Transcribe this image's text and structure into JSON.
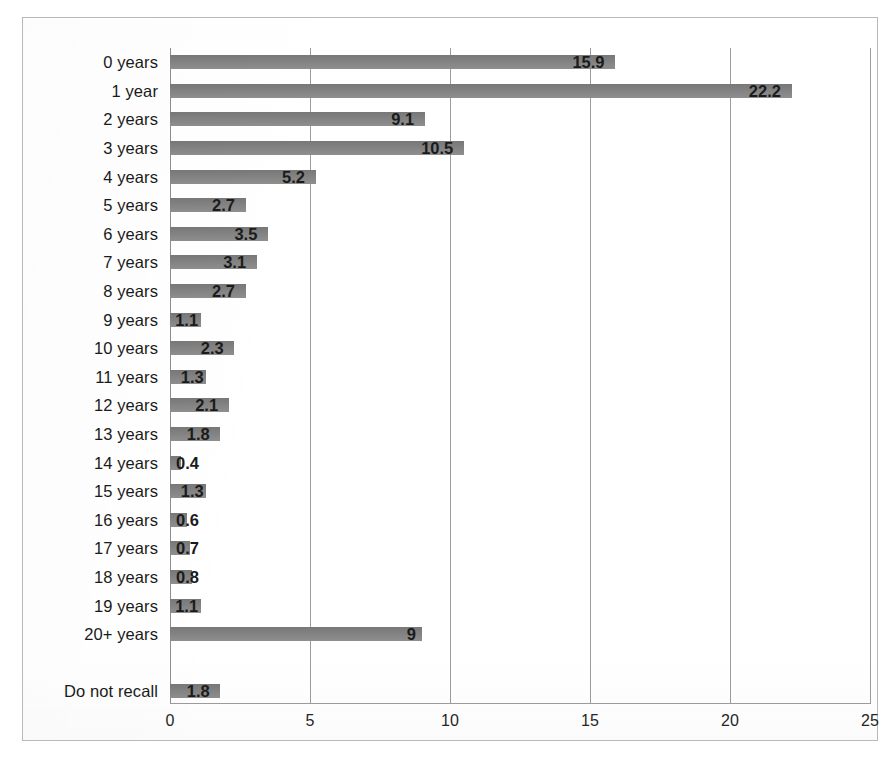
{
  "chart_data": {
    "type": "bar",
    "orientation": "horizontal",
    "title": "",
    "subtitle": "",
    "xlabel": "",
    "ylabel": "",
    "xlim": [
      0,
      25
    ],
    "xticks": [
      "0",
      "5",
      "10",
      "15",
      "20",
      "25"
    ],
    "xtick_values": [
      0,
      5,
      10,
      15,
      20,
      25
    ],
    "grid": true,
    "grid_axis": "x",
    "legend": false,
    "legend_position": "none",
    "series_color": "#7f7f7f",
    "value_label_format": "one-decimal",
    "categories": [
      "0 years",
      "1 year",
      "2 years",
      "3 years",
      "4 years",
      "5 years",
      "6 years",
      "7 years",
      "8 years",
      "9 years",
      "10 years",
      "11 years",
      "12 years",
      "13 years",
      "14 years",
      "15 years",
      "16 years",
      "17 years",
      "18 years",
      "19 years",
      "20+ years",
      "",
      "Do not recall"
    ],
    "values": [
      15.9,
      22.2,
      9.1,
      10.5,
      5.2,
      2.7,
      3.5,
      3.1,
      2.7,
      1.1,
      2.3,
      1.3,
      2.1,
      1.8,
      0.4,
      1.3,
      0.6,
      0.7,
      0.8,
      1.1,
      9,
      null,
      1.8
    ],
    "value_labels": [
      "15.9",
      "22.2",
      "9.1",
      "10.5",
      "5.2",
      "2.7",
      "3.5",
      "3.1",
      "2.7",
      "1.1",
      "2.3",
      "1.3",
      "2.1",
      "1.8",
      "0.4",
      "1.3",
      "0.6",
      "0.7",
      "0.8",
      "1.1",
      "9",
      "",
      "1.8"
    ]
  }
}
